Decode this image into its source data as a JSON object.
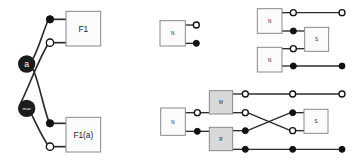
{
  "diagram": {
    "colors": {
      "background": "#ffffff",
      "wire": "#2b2b2b",
      "box_stroke": "#8a8a8a",
      "box_fill_plain": "#fbfbfb",
      "box_fill_shaded": "#d9d9d9",
      "terminal_filled": "#111111",
      "terminal_open_fill": "#ffffff",
      "node_fill": "#1c1c1c",
      "node_text": "#ffffff",
      "label_text": "#1a1a1a"
    },
    "groups": [
      {
        "id": "group-left",
        "name": "crossing-pair-group",
        "nodes": [
          {
            "id": "node-a",
            "label": "a",
            "cx": 80,
            "cy": 192,
            "r": 26
          },
          {
            "id": "node-max",
            "label": "max",
            "cx": 80,
            "cy": 325,
            "r": 26
          }
        ],
        "boxes": [
          {
            "id": "box-f1",
            "label": "F1",
            "shaded": false,
            "x": 198,
            "y": 34,
            "w": 104,
            "h": 104
          },
          {
            "id": "box-f1a",
            "label": "F1(a)",
            "shaded": false,
            "x": 198,
            "y": 352,
            "w": 104,
            "h": 104
          }
        ],
        "terminals": [
          {
            "id": "t-f1-top",
            "type": "filled",
            "cx": 150,
            "cy": 58
          },
          {
            "id": "t-f1-bottom",
            "type": "open",
            "cx": 150,
            "cy": 128
          },
          {
            "id": "t-f1a-top",
            "type": "filled",
            "cx": 150,
            "cy": 370
          },
          {
            "id": "t-f1a-bottom",
            "type": "open",
            "cx": 150,
            "cy": 440
          }
        ]
      },
      {
        "id": "group-top-middle",
        "name": "single-n-group",
        "boxes": [
          {
            "id": "box-n-single",
            "label": "N",
            "shaded": false,
            "x": 480,
            "y": 62,
            "w": 76,
            "h": 76
          }
        ],
        "terminals": [
          {
            "id": "t-n-single-open",
            "type": "open",
            "cx": 589,
            "cy": 75
          },
          {
            "id": "t-n-single-filled",
            "type": "filled",
            "cx": 589,
            "cy": 130
          }
        ]
      },
      {
        "id": "group-top-right",
        "name": "two-n-to-s-group",
        "boxes": [
          {
            "id": "box-n-upper",
            "label": "N",
            "shaded": false,
            "x": 772,
            "y": 26,
            "w": 74,
            "h": 74
          },
          {
            "id": "box-n-lower",
            "label": "N",
            "shaded": false,
            "x": 772,
            "y": 142,
            "w": 74,
            "h": 74
          },
          {
            "id": "box-s-upper",
            "label": "S",
            "shaded": false,
            "x": 914,
            "y": 82,
            "w": 72,
            "h": 72
          }
        ],
        "terminals": [
          {
            "id": "t-nu-open",
            "type": "open",
            "cx": 880,
            "cy": 38
          },
          {
            "id": "t-nu-filled",
            "type": "filled",
            "cx": 880,
            "cy": 93
          },
          {
            "id": "t-nl-open",
            "type": "open",
            "cx": 880,
            "cy": 146
          },
          {
            "id": "t-nl-filled",
            "type": "filled",
            "cx": 880,
            "cy": 198
          },
          {
            "id": "t-out-open",
            "type": "open",
            "cx": 1026,
            "cy": 38
          },
          {
            "id": "t-out-filled",
            "type": "filled",
            "cx": 1026,
            "cy": 198
          }
        ]
      },
      {
        "id": "group-bottom-right",
        "name": "n-mr-cross-s-group",
        "boxes": [
          {
            "id": "box-n-main",
            "label": "N",
            "shaded": false,
            "x": 482,
            "y": 324,
            "w": 74,
            "h": 82
          },
          {
            "id": "box-m",
            "label": "M",
            "shaded": true,
            "x": 628,
            "y": 272,
            "w": 70,
            "h": 70
          },
          {
            "id": "box-r",
            "label": "R",
            "shaded": true,
            "x": 628,
            "y": 382,
            "w": 70,
            "h": 70
          },
          {
            "id": "box-s-lower",
            "label": "S",
            "shaded": false,
            "x": 912,
            "y": 328,
            "w": 72,
            "h": 72
          }
        ],
        "terminals": [
          {
            "id": "t-nm-open",
            "type": "open",
            "cx": 592,
            "cy": 338
          },
          {
            "id": "t-nr-filled",
            "type": "filled",
            "cx": 592,
            "cy": 394
          },
          {
            "id": "t-m-open-top",
            "type": "open",
            "cx": 736,
            "cy": 282
          },
          {
            "id": "t-m-open-bottom",
            "type": "open",
            "cx": 736,
            "cy": 338
          },
          {
            "id": "t-r-filled-top",
            "type": "filled",
            "cx": 736,
            "cy": 392
          },
          {
            "id": "t-r-filled-bottom",
            "type": "filled",
            "cx": 736,
            "cy": 448
          },
          {
            "id": "t-mid-open-top",
            "type": "open",
            "cx": 878,
            "cy": 282
          },
          {
            "id": "t-s-filled-in",
            "type": "filled",
            "cx": 878,
            "cy": 338
          },
          {
            "id": "t-s-open-in",
            "type": "open",
            "cx": 878,
            "cy": 392
          },
          {
            "id": "t-mid-filled-bottom",
            "type": "filled",
            "cx": 878,
            "cy": 448
          },
          {
            "id": "t-far-open-top",
            "type": "open",
            "cx": 1026,
            "cy": 282
          },
          {
            "id": "t-far-filled-bottom",
            "type": "filled",
            "cx": 1026,
            "cy": 448
          }
        ]
      }
    ]
  }
}
